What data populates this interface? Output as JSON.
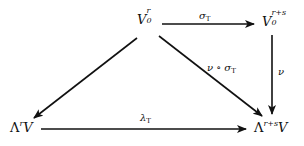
{
  "diagram": {
    "type": "commutative-diagram",
    "nodes": {
      "top_left": {
        "base": "V",
        "sub": "0",
        "sup": "r"
      },
      "top_right": {
        "base": "V",
        "sub": "0",
        "sup": "r+s"
      },
      "bottom_left": {
        "prefix": "Λ",
        "sup": "r",
        "base": "V"
      },
      "bottom_right": {
        "prefix": "Λ",
        "sup": "r+s",
        "base": "V"
      }
    },
    "arrows": {
      "sigma": {
        "from": "top_left",
        "to": "top_right",
        "label": "σ",
        "label_sub": "T"
      },
      "nu": {
        "from": "top_right",
        "to": "bottom_right",
        "label": "ν"
      },
      "composite": {
        "from": "top_left",
        "to": "bottom_right",
        "label": "ν ∘ σ",
        "label_sub": "T"
      },
      "lambda": {
        "from": "bottom_left",
        "to": "bottom_right",
        "label": "λ",
        "label_sub": "T"
      },
      "left_diag": {
        "from": "top_left",
        "to": "bottom_left",
        "label": ""
      }
    },
    "colors": {
      "ink": "#111111",
      "background": "#ffffff"
    }
  }
}
